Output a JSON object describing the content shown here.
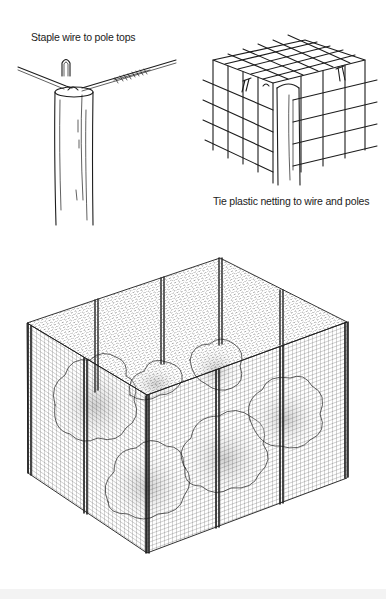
{
  "figure": {
    "panels": [
      {
        "id": "staple-detail",
        "caption": "Staple wire to pole tops",
        "elements": [
          "wooden-pole",
          "top-wire",
          "u-staple",
          "wire-twist-splice"
        ]
      },
      {
        "id": "netting-corner-detail",
        "caption": "Tie plastic netting to wire and poles",
        "elements": [
          "corner-pole",
          "plastic-netting-grid",
          "wire-ties"
        ]
      },
      {
        "id": "enclosure-overview",
        "caption": "",
        "elements": [
          "netting-enclosure-box",
          "corner-posts",
          "middle-posts",
          "shrubs-inside"
        ]
      }
    ],
    "colors": {
      "ink": "#1d1d1d",
      "background": "#ffffff",
      "shading": "#c8c8c8"
    }
  }
}
